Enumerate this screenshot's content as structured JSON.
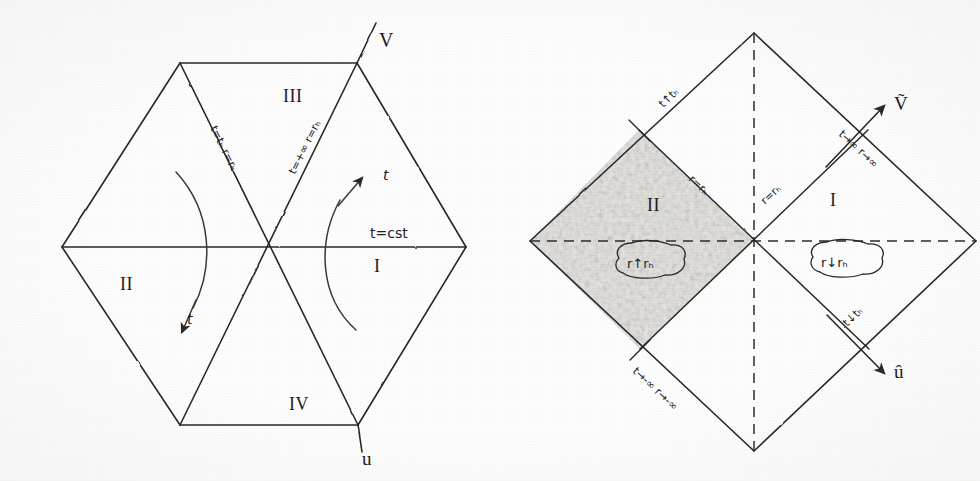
{
  "figure": {
    "kind": "hand-drawn-penrose-diagrams",
    "background_color": "#fdfdfd",
    "ink_color": "#23211f",
    "shade_color": "#c9c7c2"
  },
  "left_diagram": {
    "name": "kruskal-hexagon-diagram",
    "regions": [
      {
        "id": "I",
        "label": "I",
        "x": 380,
        "y": 265
      },
      {
        "id": "II",
        "label": "II",
        "x": 128,
        "y": 283
      },
      {
        "id": "III",
        "label": "III",
        "x": 293,
        "y": 96
      },
      {
        "id": "IV",
        "label": "IV",
        "x": 300,
        "y": 404
      }
    ],
    "axes": [
      {
        "id": "V",
        "label": "V",
        "x": 385,
        "y": 41
      },
      {
        "id": "u",
        "label": "u",
        "x": 368,
        "y": 455
      }
    ],
    "horizon_labels": [
      {
        "id": "left-horizon",
        "text": "t=tₕ  r=rₕ",
        "x": 225,
        "y": 140,
        "rotation": 47
      },
      {
        "id": "right-horizon",
        "text": "t=+∞  r=rₕ",
        "x": 295,
        "y": 140,
        "rotation": -47
      }
    ],
    "slice_label": {
      "id": "constant-time-slice",
      "text": "t=cst",
      "x": 398,
      "y": 228
    },
    "time_arrows": [
      {
        "id": "time-arrow-region-I",
        "label": "t",
        "x": 385,
        "y": 173
      },
      {
        "id": "time-arrow-region-II",
        "label": "t",
        "x": 184,
        "y": 318
      }
    ]
  },
  "right_diagram": {
    "name": "penrose-diamond-diagram",
    "regions": [
      {
        "id": "I",
        "label": "I",
        "x": 845,
        "y": 199
      },
      {
        "id": "II",
        "label": "II",
        "x": 659,
        "y": 204
      }
    ],
    "axes": [
      {
        "id": "V-tilde",
        "label": "Ṽ",
        "x": 903,
        "y": 118
      },
      {
        "id": "u-hat",
        "label": "û",
        "x": 903,
        "y": 367
      }
    ],
    "edge_labels": [
      {
        "id": "upper-left-edge",
        "text": "t↑tₕ",
        "x": 678,
        "y": 103,
        "rotation": -45
      },
      {
        "id": "upper-right-edge",
        "text": "t→∞  r→∞",
        "x": 881,
        "y": 163,
        "rotation": 45
      },
      {
        "id": "lower-right-edge",
        "text": "t↓tₕ",
        "x": 876,
        "y": 305,
        "rotation": -45
      },
      {
        "id": "lower-left-edge",
        "text": "t→-∞  r→-∞",
        "x": 679,
        "y": 392,
        "rotation": 45
      }
    ],
    "horizon_labels": [
      {
        "id": "horizon-left",
        "text": "r=rₕ",
        "x": 713,
        "y": 180,
        "rotation": 45
      },
      {
        "id": "horizon-right",
        "text": "r=rₕ",
        "x": 781,
        "y": 183,
        "rotation": -45
      }
    ],
    "circled_labels": [
      {
        "id": "region-II-radial-trend",
        "text": "r↑rₕ",
        "x": 652,
        "y": 268
      },
      {
        "id": "region-I-radial-trend",
        "text": "r↓rₕ",
        "x": 846,
        "y": 267
      }
    ],
    "shaded_region": {
      "id": "region-II-shading",
      "color": "#cfcdc8"
    },
    "dashed_axes": [
      {
        "id": "vertical-dashed-axis"
      },
      {
        "id": "horizontal-dashed-axis"
      }
    ]
  }
}
